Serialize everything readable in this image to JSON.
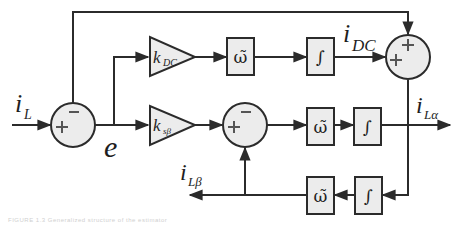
{
  "diagram": {
    "labels": {
      "input": {
        "main": "i",
        "sub": "L"
      },
      "error": "e",
      "dc_out": {
        "main": "i",
        "sub": "DC"
      },
      "alpha_out": {
        "main": "i",
        "sub": "Lα"
      },
      "beta_out": {
        "main": "i",
        "sub": "Lβ"
      }
    },
    "blocks": {
      "gain_dc": {
        "main": "k",
        "sub": "DC"
      },
      "gain_sb": {
        "main": "k",
        "sub": "sβ"
      },
      "omega": "ω̃",
      "integrator": "∫"
    },
    "summers": {
      "input_sum": {
        "signs": [
          "+",
          "−"
        ]
      },
      "mid_sum": {
        "signs": [
          "+",
          "−"
        ]
      },
      "out_sum": {
        "signs": [
          "+",
          "+"
        ]
      }
    },
    "colors": {
      "line": "#2b2b2b",
      "fill": "#ececec",
      "text": "#1e1e1e"
    }
  },
  "caption": "FIGURE 1.3   Generalized structure of the estimator"
}
